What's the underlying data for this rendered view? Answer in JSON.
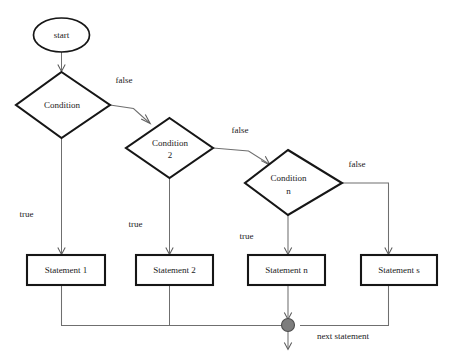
{
  "diagram": {
    "colors": {
      "shape_stroke": "#161616",
      "shape_fill": "#ffffff",
      "connector": "#6f6f6f",
      "merge_dot_fill": "#7d7d7d",
      "merge_dot_stroke": "#4d4d4d",
      "text": "#1a1a1a",
      "background": "#ffffff"
    },
    "nodes": {
      "start": {
        "label": "start",
        "shape": "ellipse"
      },
      "condition_1": {
        "label": "Condition",
        "shape": "diamond"
      },
      "condition_2": {
        "label_line1": "Condition",
        "label_line2": "2",
        "shape": "diamond"
      },
      "condition_n": {
        "label_line1": "Condition",
        "label_line2": "n",
        "shape": "diamond"
      },
      "statement_1": {
        "label": "Statement 1",
        "shape": "rectangle"
      },
      "statement_2": {
        "label": "Statement 2",
        "shape": "rectangle"
      },
      "statement_n": {
        "label": "Statement n",
        "shape": "rectangle"
      },
      "statement_s": {
        "label": "Statement s",
        "shape": "rectangle"
      },
      "merge": {
        "label": "",
        "shape": "filled-circle"
      }
    },
    "edge_labels": {
      "false_1": "false",
      "false_2": "false",
      "false_3": "false",
      "true_1": "true",
      "true_2": "true",
      "true_n": "true",
      "exit": "next statement"
    }
  }
}
